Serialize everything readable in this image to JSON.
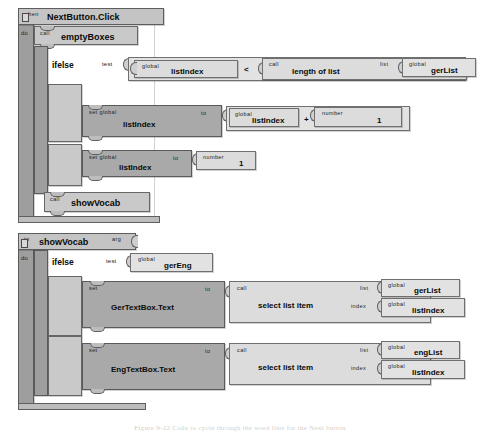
{
  "figure": {
    "caption": "Figure 9-22    Code to cycle through the word lists for the Next button",
    "background_color": "#ffffff",
    "block_colors": {
      "event_hat": "#c4c4c4",
      "control": "#c9c9c9",
      "action_dark": "#a9a9a9",
      "value_light": "#e2e2e2",
      "spine": "#9e9e9e",
      "outline": "#5f5f5f"
    }
  },
  "blocks": {
    "event": {
      "keyword": "when",
      "name": "NextButton.Click",
      "body_label": "do"
    },
    "call_empty_boxes": {
      "keyword": "call",
      "name": "emptyBoxes"
    },
    "ifelse1": {
      "name": "ifelse",
      "test_label": "test",
      "then_label": "then-do",
      "else_label": "else-do"
    },
    "test1": {
      "get_global_keyword": "global",
      "get_global_name": "listIndex",
      "operator": "<",
      "call_keyword": "call",
      "call_name": "length of list",
      "list_socket_label": "list",
      "list_global_keyword": "global",
      "list_global_name": "gerList"
    },
    "then1": {
      "set_keyword": "set global",
      "set_name": "listIndex",
      "to_label": "to",
      "left_global_keyword": "global",
      "left_global_name": "listIndex",
      "operator": "+",
      "number_keyword": "number",
      "number_value": "1"
    },
    "else1": {
      "set_keyword": "set global",
      "set_name": "listIndex",
      "to_label": "to",
      "number_keyword": "number",
      "number_value": "1"
    },
    "call_show_vocab": {
      "keyword": "call",
      "name": "showVocab"
    },
    "procedure": {
      "keyword": "to",
      "name": "showVocab",
      "arg_label": "arg",
      "body_label": "do"
    },
    "ifelse2": {
      "name": "ifelse",
      "test_label": "test",
      "then_label": "then-do",
      "else_label": "else-do"
    },
    "test2": {
      "get_global_keyword": "global",
      "get_global_name": "gerEng"
    },
    "then2": {
      "set_keyword": "set",
      "set_name": "GerTextBox.Text",
      "to_label": "to",
      "call_keyword": "call",
      "call_name": "select list item",
      "list_socket_label": "list",
      "list_global_keyword": "global",
      "list_global_name": "gerList",
      "index_socket_label": "index",
      "index_global_keyword": "global",
      "index_global_name": "listIndex"
    },
    "else2": {
      "set_keyword": "set",
      "set_name": "EngTextBox.Text",
      "to_label": "to",
      "call_keyword": "call",
      "call_name": "select list item",
      "list_socket_label": "list",
      "list_global_keyword": "global",
      "list_global_name": "engList",
      "index_socket_label": "index",
      "index_global_keyword": "global",
      "index_global_name": "listIndex"
    }
  }
}
